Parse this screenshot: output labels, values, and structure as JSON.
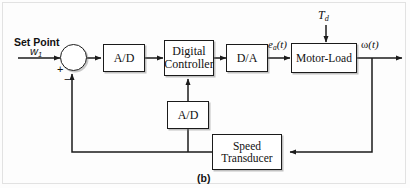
{
  "figure": {
    "caption": "(b)",
    "blocks": [
      {
        "id": "ad_forward",
        "label": "A/D"
      },
      {
        "id": "digital_controller",
        "line1": "Digital",
        "line2": "Controller"
      },
      {
        "id": "da",
        "label": "D/A"
      },
      {
        "id": "motor_load",
        "label": "Motor-Load"
      },
      {
        "id": "ad_feedback",
        "label": "A/D"
      },
      {
        "id": "speed_transducer",
        "line1": "Speed",
        "line2": "Transducer"
      }
    ],
    "signals": {
      "set_point_title": "Set Point",
      "set_point_symbol": "w",
      "set_point_subscript": "1",
      "disturbance_symbol": "T",
      "disturbance_subscript": "d",
      "control_voltage_symbol": "e",
      "control_voltage_subscript": "a",
      "control_voltage_arg": "(t)",
      "output_symbol": "ω",
      "output_arg": "(t)"
    },
    "summing_junction": {
      "plus": "+",
      "minus": "−"
    },
    "colors": {
      "line": "#1b1b1b",
      "background": "#fdfdfd",
      "frame": "#e2e2e2"
    }
  }
}
